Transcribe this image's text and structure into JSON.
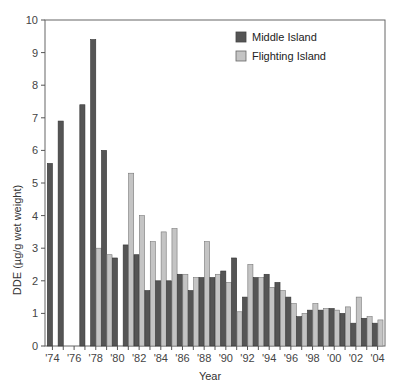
{
  "chart_data": {
    "type": "bar",
    "title": "",
    "xlabel": "Year",
    "ylabel": "DDE (µg/g wet weight)",
    "ylim": [
      0,
      10
    ],
    "yticks": [
      0,
      1,
      2,
      3,
      4,
      5,
      6,
      7,
      8,
      9,
      10
    ],
    "xtick_labels": [
      "'74",
      "'76",
      "'78",
      "'80",
      "'82",
      "'84",
      "'86",
      "'88",
      "'90",
      "'92",
      "'94",
      "'96",
      "'98",
      "'00",
      "'02",
      "'04"
    ],
    "grid": false,
    "legend_position": "upper right",
    "categories": [
      "1974",
      "1975",
      "1976",
      "1977",
      "1978",
      "1979",
      "1980",
      "1981",
      "1982",
      "1983",
      "1984",
      "1985",
      "1986",
      "1987",
      "1988",
      "1989",
      "1990",
      "1991",
      "1992",
      "1993",
      "1994",
      "1995",
      "1996",
      "1997",
      "1998",
      "1999",
      "2000",
      "2001",
      "2002",
      "2003",
      "2004"
    ],
    "series": [
      {
        "name": "Middle Island",
        "color": "#555555",
        "values": [
          5.6,
          6.9,
          null,
          7.4,
          9.4,
          6.0,
          2.7,
          3.1,
          2.8,
          1.7,
          2.0,
          2.0,
          2.2,
          1.7,
          2.1,
          2.1,
          2.3,
          2.7,
          1.5,
          2.1,
          2.2,
          1.95,
          1.5,
          0.9,
          1.1,
          1.1,
          1.15,
          1.0,
          0.7,
          0.85,
          0.7
        ]
      },
      {
        "name": "Flighting Island",
        "color": "#c4c4c4",
        "values": [
          null,
          null,
          null,
          null,
          3.0,
          2.8,
          null,
          5.3,
          4.0,
          3.2,
          3.5,
          3.6,
          2.2,
          2.1,
          3.2,
          2.2,
          1.95,
          1.05,
          2.5,
          2.1,
          1.8,
          1.7,
          1.3,
          1.0,
          1.3,
          1.15,
          1.1,
          1.2,
          1.5,
          0.9,
          0.8
        ]
      }
    ]
  },
  "legend": {
    "items": [
      {
        "label": "Middle Island",
        "color": "#555555"
      },
      {
        "label": "Flighting Island",
        "color": "#c4c4c4"
      }
    ]
  },
  "axes": {
    "xlabel": "Year",
    "ylabel": "DDE (µg/g wet weight)"
  }
}
